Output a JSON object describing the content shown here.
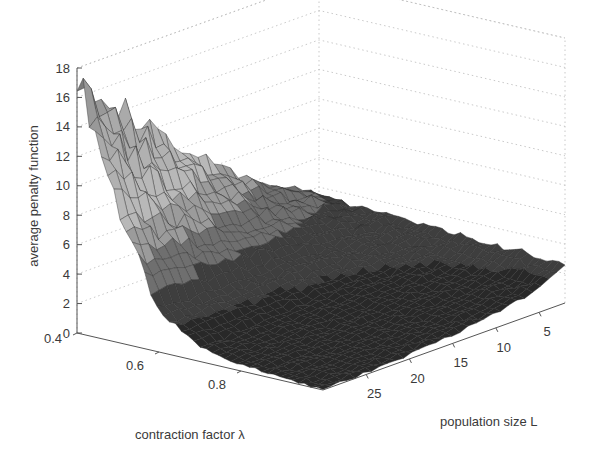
{
  "chart_data": {
    "type": "surface3d",
    "title": "",
    "zlabel": "average penalty function",
    "xlabel": "contraction factor λ",
    "ylabel": "population size L",
    "z_ticks": [
      "0",
      "2",
      "4",
      "6",
      "8",
      "10",
      "12",
      "14",
      "16",
      "18"
    ],
    "z_range": [
      0,
      18
    ],
    "lambda_ticks": [
      "0.4",
      "0.6",
      "0.8"
    ],
    "lambda_range": [
      0.4,
      1.0
    ],
    "L_ticks": [
      "5",
      "10",
      "15",
      "20",
      "25"
    ],
    "L_range": [
      2,
      30
    ],
    "grid": true,
    "colormap": "gray",
    "lambda_values": [
      0.4,
      0.5,
      0.6,
      0.7,
      0.8,
      0.9,
      1.0
    ],
    "L_values": [
      2,
      5,
      10,
      15,
      20,
      25,
      30
    ],
    "z_values": [
      [
        3.4,
        3.3,
        3.2,
        3.0,
        2.9,
        2.8,
        2.7
      ],
      [
        4.6,
        3.8,
        2.9,
        2.4,
        2.0,
        1.8,
        1.6
      ],
      [
        6.2,
        4.4,
        2.8,
        1.9,
        1.5,
        1.2,
        1.0
      ],
      [
        8.3,
        5.2,
        2.7,
        1.6,
        1.1,
        0.8,
        0.6
      ],
      [
        11.0,
        6.3,
        2.6,
        1.3,
        0.8,
        0.5,
        0.3
      ],
      [
        14.2,
        7.6,
        2.6,
        1.1,
        0.6,
        0.3,
        0.1
      ],
      [
        17.8,
        9.2,
        2.6,
        1.0,
        0.4,
        0.2,
        0.0
      ]
    ],
    "annotations": {
      "peak": {
        "lambda": 1.0,
        "L": 2,
        "z": 17.8
      }
    }
  }
}
